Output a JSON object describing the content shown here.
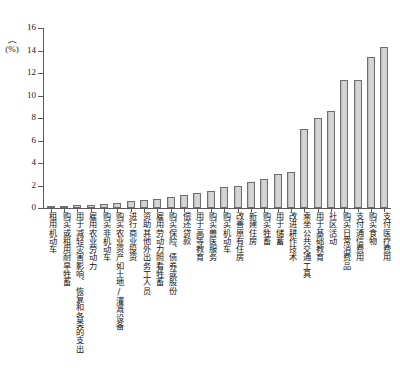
{
  "chart_data": {
    "type": "bar",
    "title": "",
    "subtitle": "",
    "xlabel": "",
    "ylabel": "(%)",
    "ylim": [
      0,
      16
    ],
    "ytick_values": [
      0,
      2,
      4,
      6,
      8,
      10,
      12,
      14,
      16
    ],
    "ytick_labels": [
      "0",
      "2",
      "4",
      "6",
      "8",
      "10",
      "12",
      "14",
      "16"
    ],
    "grid": false,
    "legend": "none",
    "bar_fill_color": "#cfcfcf",
    "bar_edge_color": "#6e6e6e",
    "axis_color": "#5a5a5a",
    "categories": [
      "租用机动车",
      "购买或租用耐旱牲畜",
      "用于减轻灾害影响、恢复和各类的支出",
      "雇用农业劳动力",
      "购买非机动车",
      "购买农业资产如土地/灌溉设备",
      "进行商业投资",
      "资助其他外出务工人员",
      "雇用劳动力照看牲畜",
      "购买保险、债券或股份",
      "偿还贷款",
      "用于高等教育",
      "购买兽医服务",
      "购买机动车",
      "改善原有住房",
      "新建住房",
      "购买牲畜",
      "用于储蓄",
      "改进耕作技术",
      "乘坐公共交通工具",
      "用于基础教育",
      "社区活动",
      "购买日常消费品",
      "支付通信费用",
      "购买食物",
      "支付医疗费用"
    ],
    "values": [
      0.15,
      0.2,
      0.25,
      0.3,
      0.35,
      0.45,
      0.6,
      0.7,
      0.8,
      1.0,
      1.2,
      1.3,
      1.5,
      1.9,
      2.0,
      2.3,
      2.6,
      3.0,
      3.2,
      7.0,
      8.0,
      8.6,
      11.4,
      11.4,
      13.4,
      14.3
    ]
  }
}
